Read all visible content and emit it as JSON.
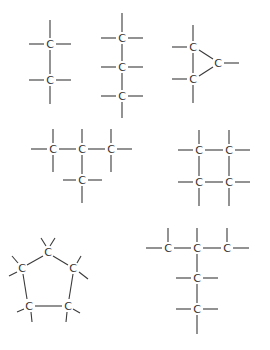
{
  "diagram": {
    "title": "",
    "atom_label": "C",
    "colors": {
      "bond": "#3a3a3a",
      "atom": "#333333",
      "background": "#ffffff"
    },
    "molecules": [
      {
        "name": "ethane",
        "atoms": [
          {
            "label": "C",
            "x": 50,
            "y": 44
          },
          {
            "label": "C",
            "x": 50,
            "y": 80
          }
        ],
        "bonds": [
          [
            50,
            20,
            50,
            38
          ],
          [
            29,
            44,
            44,
            44
          ],
          [
            56,
            44,
            71,
            44
          ],
          [
            50,
            50,
            50,
            74
          ],
          [
            29,
            80,
            44,
            80
          ],
          [
            56,
            80,
            71,
            80
          ],
          [
            50,
            86,
            50,
            104
          ]
        ]
      },
      {
        "name": "propane",
        "atoms": [
          {
            "label": "C",
            "x": 122,
            "y": 38
          },
          {
            "label": "C",
            "x": 122,
            "y": 67
          },
          {
            "label": "C",
            "x": 122,
            "y": 96
          }
        ],
        "bonds": [
          [
            122,
            13,
            122,
            32
          ],
          [
            101,
            38,
            116,
            38
          ],
          [
            128,
            38,
            143,
            38
          ],
          [
            122,
            44,
            122,
            61
          ],
          [
            101,
            67,
            116,
            67
          ],
          [
            128,
            67,
            143,
            67
          ],
          [
            122,
            73,
            122,
            90
          ],
          [
            101,
            96,
            116,
            96
          ],
          [
            128,
            96,
            143,
            96
          ],
          [
            122,
            102,
            122,
            118
          ]
        ]
      },
      {
        "name": "cyclopropane",
        "atoms": [
          {
            "label": "C",
            "x": 193,
            "y": 47
          },
          {
            "label": "C",
            "x": 193,
            "y": 79
          },
          {
            "label": "C",
            "x": 218,
            "y": 63
          }
        ],
        "bonds": [
          [
            193,
            25,
            193,
            41
          ],
          [
            172,
            47,
            187,
            47
          ],
          [
            193,
            53,
            193,
            73
          ],
          [
            172,
            79,
            187,
            79
          ],
          [
            193,
            85,
            193,
            103
          ],
          [
            199,
            50,
            213,
            59
          ],
          [
            199,
            76,
            213,
            67
          ],
          [
            224,
            63,
            239,
            63
          ]
        ]
      },
      {
        "name": "isobutane",
        "atoms": [
          {
            "label": "C",
            "x": 53,
            "y": 149
          },
          {
            "label": "C",
            "x": 82,
            "y": 149
          },
          {
            "label": "C",
            "x": 111,
            "y": 149
          },
          {
            "label": "C",
            "x": 82,
            "y": 180
          }
        ],
        "bonds": [
          [
            31,
            149,
            47,
            149
          ],
          [
            53,
            129,
            53,
            143
          ],
          [
            53,
            155,
            53,
            172
          ],
          [
            59,
            149,
            76,
            149
          ],
          [
            82,
            129,
            82,
            143
          ],
          [
            88,
            149,
            105,
            149
          ],
          [
            111,
            129,
            111,
            143
          ],
          [
            111,
            155,
            111,
            172
          ],
          [
            117,
            149,
            132,
            149
          ],
          [
            82,
            155,
            82,
            174
          ],
          [
            63,
            180,
            76,
            180
          ],
          [
            88,
            180,
            102,
            180
          ],
          [
            82,
            186,
            82,
            203
          ]
        ]
      },
      {
        "name": "cyclobutane",
        "atoms": [
          {
            "label": "C",
            "x": 199,
            "y": 150
          },
          {
            "label": "C",
            "x": 229,
            "y": 150
          },
          {
            "label": "C",
            "x": 199,
            "y": 182
          },
          {
            "label": "C",
            "x": 229,
            "y": 182
          }
        ],
        "bonds": [
          [
            178,
            150,
            193,
            150
          ],
          [
            199,
            130,
            199,
            144
          ],
          [
            205,
            150,
            223,
            150
          ],
          [
            229,
            130,
            229,
            144
          ],
          [
            235,
            150,
            250,
            150
          ],
          [
            199,
            156,
            199,
            176
          ],
          [
            229,
            156,
            229,
            176
          ],
          [
            178,
            182,
            193,
            182
          ],
          [
            205,
            182,
            223,
            182
          ],
          [
            235,
            182,
            250,
            182
          ],
          [
            199,
            188,
            199,
            206
          ],
          [
            229,
            188,
            229,
            206
          ]
        ]
      },
      {
        "name": "cyclopentane",
        "atoms": [
          {
            "label": "C",
            "x": 48,
            "y": 252
          },
          {
            "label": "C",
            "x": 22,
            "y": 268
          },
          {
            "label": "C",
            "x": 73,
            "y": 268
          },
          {
            "label": "C",
            "x": 29,
            "y": 306
          },
          {
            "label": "C",
            "x": 68,
            "y": 306
          }
        ],
        "bonds": [
          [
            41,
            238,
            46,
            246
          ],
          [
            55,
            238,
            50,
            246
          ],
          [
            43,
            256,
            27,
            265
          ],
          [
            53,
            256,
            68,
            265
          ],
          [
            12,
            256,
            18,
            263
          ],
          [
            9,
            276,
            17,
            272
          ],
          [
            81,
            256,
            77,
            263
          ],
          [
            88,
            279,
            79,
            272
          ],
          [
            23,
            274,
            27,
            299
          ],
          [
            73,
            274,
            69,
            299
          ],
          [
            35,
            306,
            62,
            306
          ],
          [
            17,
            312,
            24,
            309
          ],
          [
            31,
            312,
            32,
            322
          ],
          [
            80,
            313,
            73,
            309
          ],
          [
            67,
            312,
            66,
            322
          ]
        ]
      },
      {
        "name": "2,2-dimethylbutane-like",
        "atoms": [
          {
            "label": "C",
            "x": 168,
            "y": 248
          },
          {
            "label": "C",
            "x": 197,
            "y": 248
          },
          {
            "label": "C",
            "x": 227,
            "y": 248
          },
          {
            "label": "C",
            "x": 197,
            "y": 278
          },
          {
            "label": "C",
            "x": 197,
            "y": 309
          }
        ],
        "bonds": [
          [
            146,
            248,
            162,
            248
          ],
          [
            168,
            228,
            168,
            242
          ],
          [
            174,
            248,
            191,
            248
          ],
          [
            197,
            228,
            197,
            242
          ],
          [
            203,
            248,
            221,
            248
          ],
          [
            227,
            228,
            227,
            242
          ],
          [
            233,
            248,
            249,
            248
          ],
          [
            197,
            254,
            197,
            272
          ],
          [
            176,
            278,
            191,
            278
          ],
          [
            203,
            278,
            218,
            278
          ],
          [
            197,
            284,
            197,
            303
          ],
          [
            176,
            309,
            191,
            309
          ],
          [
            203,
            309,
            218,
            309
          ],
          [
            197,
            315,
            197,
            334
          ]
        ]
      }
    ]
  }
}
